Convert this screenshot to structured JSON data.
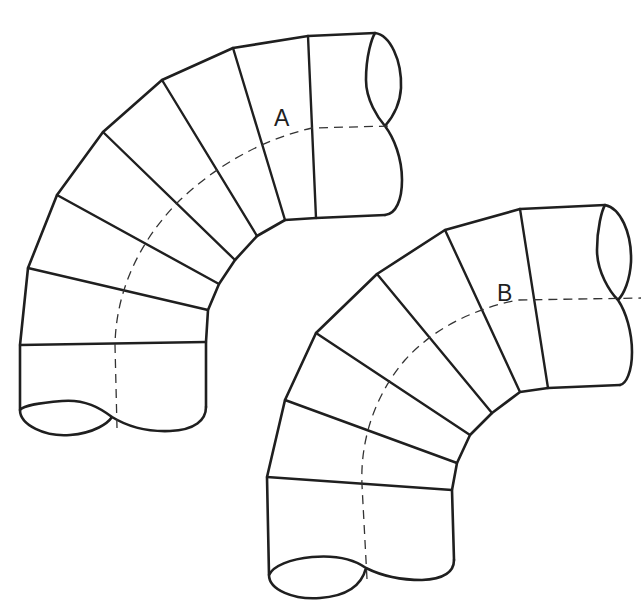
{
  "figure": {
    "background_color": "#ffffff",
    "line_color": "#1f1f1f",
    "elbows": [
      {
        "id": "A",
        "label": "A",
        "segment_count": 7,
        "has_dashed_centerline": true
      },
      {
        "id": "B",
        "label": "B",
        "segment_count": 6,
        "has_dashed_centerline": true
      }
    ]
  }
}
